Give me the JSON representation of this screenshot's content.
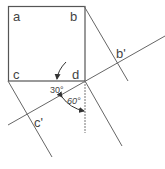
{
  "diagram": {
    "title": "",
    "labels": {
      "a": "a",
      "b": "b",
      "c": "c",
      "d": "d",
      "b_prime": "b'",
      "c_prime": "c'",
      "angle_30": "30°",
      "angle_60": "60°"
    },
    "colors": {
      "line": "#555555",
      "text": "#444444",
      "background": "#ffffff"
    },
    "points": {
      "a": [
        8,
        6
      ],
      "b": [
        84,
        6
      ],
      "c": [
        8,
        81
      ],
      "d": [
        85,
        81
      ],
      "b_prime": [
        118,
        60
      ],
      "c_prime": [
        35,
        113
      ]
    },
    "angles": {
      "projection_line_deg": 30,
      "projector_to_vertical_deg": 60
    }
  }
}
